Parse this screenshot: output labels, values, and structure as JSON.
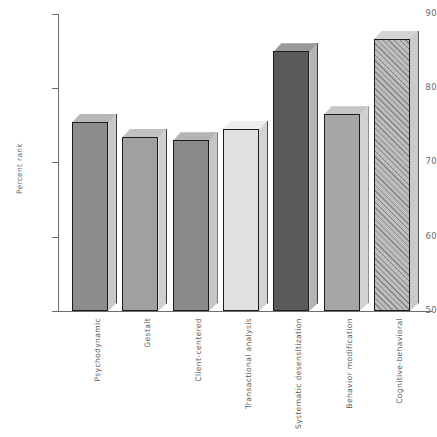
{
  "chart_data": {
    "type": "bar",
    "title": "",
    "subtitle": "",
    "xlabel": "",
    "ylabel": "Percent rank",
    "ylim": [
      50,
      90
    ],
    "ytick_labels": [
      "50",
      "60",
      "70",
      "80",
      "90"
    ],
    "ytick_values": [
      50,
      60,
      70,
      80,
      90
    ],
    "grid": false,
    "legend": null,
    "categories": [
      "Psychodynamic",
      "Gestalt",
      "Client-centered",
      "Transactional analysis",
      "Systematic desensitization",
      "Behavior modification",
      "Cognitive-behavioral"
    ],
    "values": [
      75.5,
      73.5,
      73.0,
      74.5,
      85.0,
      76.5,
      86.7
    ],
    "bar_styles": [
      {
        "fill": "#8d8d8d",
        "top": "#b8b8b8",
        "side": "#c9c9c9",
        "hatched": false
      },
      {
        "fill": "#a0a0a0",
        "top": "#c2c2c2",
        "side": "#cfcfcf",
        "hatched": false
      },
      {
        "fill": "#8a8a8a",
        "top": "#b5b5b5",
        "side": "#c6c6c6",
        "hatched": false
      },
      {
        "fill": "#e0e0e0",
        "top": "#ededed",
        "side": "#d3d3d3",
        "hatched": false
      },
      {
        "fill": "#5a5a5a",
        "top": "#9a9a9a",
        "side": "#b4b4b4",
        "hatched": false
      },
      {
        "fill": "#a6a6a6",
        "top": "#c6c6c6",
        "side": "#d2d2d2",
        "hatched": false
      },
      {
        "fill": "#bdbdbd",
        "top": "#d4d4d4",
        "side": "#cacaca",
        "hatched": true
      }
    ],
    "axis_color": "#6e6e6e",
    "text_color": "#6a6a6a",
    "background": "#ffffff"
  }
}
